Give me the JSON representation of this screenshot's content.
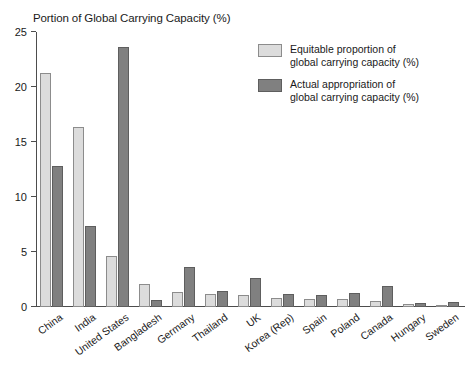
{
  "chart_data": {
    "type": "bar",
    "title": "Portion of Global Carrying Capacity (%)",
    "xlabel": "",
    "ylabel": "",
    "ylim": [
      0,
      25
    ],
    "yticks": [
      0,
      5,
      10,
      15,
      20,
      25
    ],
    "ytick_labels": [
      "0",
      "5",
      "10",
      "15",
      "20",
      "25"
    ],
    "grid": false,
    "legend_position": "top-right",
    "categories": [
      "China",
      "India",
      "United States",
      "Bangladesh",
      "Germany",
      "Thailand",
      "UK",
      "Korea (Rep)",
      "Spain",
      "Poland",
      "Canada",
      "Hungary",
      "Sweden"
    ],
    "series": [
      {
        "name": "Equitable proportion of global carrying capacity (%)",
        "name_line1": "Equitable proportion of",
        "name_line2": "global carrying capacity (%)",
        "color": "#dcdcdc",
        "values": [
          21.3,
          16.4,
          4.6,
          2.1,
          1.35,
          1.2,
          1.05,
          0.8,
          0.75,
          0.7,
          0.55,
          0.25,
          0.12
        ]
      },
      {
        "name": "Actual appropriation of global carrying capacity (%)",
        "name_line1": "Actual appropriation of",
        "name_line2": "global carrying capacity (%)",
        "color": "#808080",
        "values": [
          12.8,
          7.4,
          23.6,
          0.65,
          3.65,
          1.5,
          2.65,
          1.15,
          1.1,
          1.25,
          1.95,
          0.4,
          0.45
        ]
      }
    ]
  }
}
